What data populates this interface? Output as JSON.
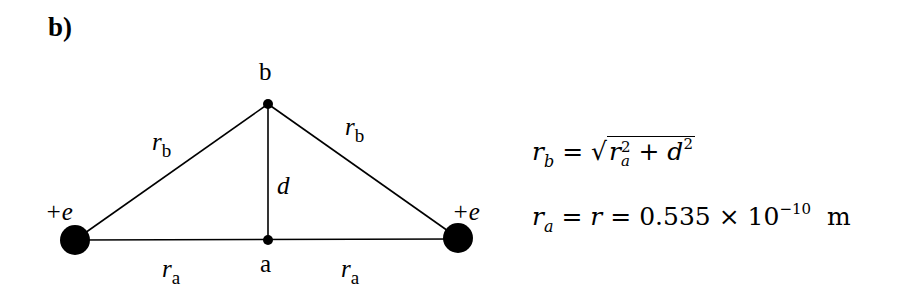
{
  "figure": {
    "part_label": "b)",
    "points": {
      "b": {
        "label": "b"
      },
      "a": {
        "label": "a"
      }
    },
    "charges": {
      "left": {
        "label": "+e"
      },
      "right": {
        "label": "+e"
      }
    },
    "edge_labels": {
      "rb_left": {
        "var": "r",
        "sub": "b"
      },
      "rb_right": {
        "var": "r",
        "sub": "b"
      },
      "d": {
        "var": "d"
      },
      "ra_left": {
        "var": "r",
        "sub": "a"
      },
      "ra_right": {
        "var": "r",
        "sub": "a"
      }
    }
  },
  "equations": {
    "eq1": {
      "lhs_var": "r",
      "lhs_sub": "b",
      "eq": "=",
      "sqrt_prefix": "√",
      "t1_var": "r",
      "t1_sup": "2",
      "t1_sub": "a",
      "plus": "+",
      "t2_var": "d",
      "t2_sup": "2"
    },
    "eq2": {
      "lhs_var": "r",
      "lhs_sub": "a",
      "eq1": "=",
      "mid_var": "r",
      "eq2": "=",
      "value": "0.535 × 10",
      "exp": "−10",
      "unit": "m"
    }
  }
}
